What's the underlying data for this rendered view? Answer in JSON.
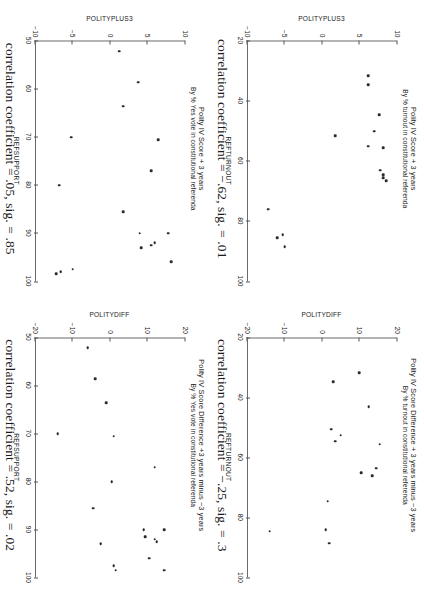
{
  "figure": {
    "orientation": "rotated-90-clockwise",
    "panel_count": 4,
    "marker_color": "#2b2b2b",
    "axis_color": "#6a6a6a"
  },
  "chart_data": [
    {
      "id": "top-left",
      "type": "scatter",
      "title": "Polity IV Score + 3 years",
      "subtitle": "By % turnout in constitutional referenda",
      "xlabel": "REFTURNOUT",
      "ylabel": "POLITYPLUS3",
      "xlim": [
        20,
        100
      ],
      "ylim": [
        -10,
        10
      ],
      "xticks": [
        20,
        40,
        60,
        80,
        100
      ],
      "yticks": [
        10,
        5,
        0,
        -5,
        -10
      ],
      "grid": false,
      "caption": "correlation coefficient = −.62, sig. = .01",
      "correlation_coefficient": -0.62,
      "significance": 0.01,
      "points": [
        {
          "x": 31.5,
          "y": 6.2
        },
        {
          "x": 34.5,
          "y": 6.2
        },
        {
          "x": 44.5,
          "y": 7.7
        },
        {
          "x": 50.0,
          "y": 7.0
        },
        {
          "x": 51.5,
          "y": 1.8
        },
        {
          "x": 55.5,
          "y": 8.2
        },
        {
          "x": 55.0,
          "y": 6.2
        },
        {
          "x": 63.0,
          "y": 7.8
        },
        {
          "x": 64.5,
          "y": 8.2
        },
        {
          "x": 65.5,
          "y": 8.2
        },
        {
          "x": 66.5,
          "y": 8.6
        },
        {
          "x": 76.0,
          "y": -7.2
        },
        {
          "x": 84.5,
          "y": -5.3
        },
        {
          "x": 85.5,
          "y": -6.0
        },
        {
          "x": 88.5,
          "y": -5.0
        }
      ]
    },
    {
      "id": "top-right",
      "type": "scatter",
      "title": "Polity IV Score Difference + 3 years minus −3 years",
      "subtitle": "By % turnout in constitutional referenda",
      "xlabel": "REFTURNOUT",
      "ylabel": "POLITYDIFF",
      "xlim": [
        20,
        100
      ],
      "ylim": [
        -20,
        20
      ],
      "xticks": [
        20,
        40,
        60,
        80,
        100
      ],
      "yticks": [
        20,
        10,
        0,
        -10,
        -20
      ],
      "grid": false,
      "caption": "correlation coefficient = −.25, sig. = .3",
      "correlation_coefficient": -0.25,
      "significance": 0.3,
      "points": [
        {
          "x": 31.5,
          "y": 10.0
        },
        {
          "x": 34.5,
          "y": 3.0
        },
        {
          "x": 43.0,
          "y": 12.5
        },
        {
          "x": 50.5,
          "y": 2.5
        },
        {
          "x": 52.5,
          "y": 5.0
        },
        {
          "x": 54.5,
          "y": 3.5
        },
        {
          "x": 55.5,
          "y": 15.5
        },
        {
          "x": 63.5,
          "y": 14.5
        },
        {
          "x": 65.0,
          "y": 10.5
        },
        {
          "x": 66.0,
          "y": 13.5
        },
        {
          "x": 74.5,
          "y": 1.5
        },
        {
          "x": 84.0,
          "y": 1.0
        },
        {
          "x": 84.5,
          "y": -14.0
        },
        {
          "x": 88.5,
          "y": 2.0
        }
      ]
    },
    {
      "id": "bottom-left",
      "type": "scatter",
      "title": "Polity IV Score + 3 years",
      "subtitle": "By % Yes vote in constitutional referenda",
      "xlabel": "REFSUPPORT",
      "ylabel": "POLITYPLUS3",
      "xlim": [
        50,
        100
      ],
      "ylim": [
        -10,
        10
      ],
      "xticks": [
        50,
        60,
        70,
        80,
        90,
        100
      ],
      "yticks": [
        10,
        5,
        0,
        -5,
        -10
      ],
      "grid": false,
      "caption": "correlation coefficient = .05, sig. = .85",
      "correlation_coefficient": 0.05,
      "significance": 0.85,
      "points": [
        {
          "x": 52.0,
          "y": 1.2
        },
        {
          "x": 58.5,
          "y": 3.8
        },
        {
          "x": 63.5,
          "y": 1.8
        },
        {
          "x": 70.5,
          "y": 6.5
        },
        {
          "x": 70.0,
          "y": -5.2
        },
        {
          "x": 77.0,
          "y": 5.5
        },
        {
          "x": 80.0,
          "y": -6.8
        },
        {
          "x": 85.5,
          "y": 1.8
        },
        {
          "x": 90.0,
          "y": 7.8
        },
        {
          "x": 90.0,
          "y": 4.0
        },
        {
          "x": 92.0,
          "y": 6.0
        },
        {
          "x": 92.5,
          "y": 5.5
        },
        {
          "x": 93.0,
          "y": 4.2
        },
        {
          "x": 96.0,
          "y": 8.2
        },
        {
          "x": 97.5,
          "y": -5.0
        },
        {
          "x": 98.0,
          "y": -6.6
        },
        {
          "x": 98.5,
          "y": -7.2
        }
      ]
    },
    {
      "id": "bottom-right",
      "type": "scatter",
      "title": "Polity IV Score Difference +3 years minus −3 years",
      "subtitle": "By % Yes vote in constitutional referenda",
      "xlabel": "REFSUPPORT",
      "ylabel": "POLITYDIFF",
      "xlim": [
        50,
        100
      ],
      "ylim": [
        -20,
        20
      ],
      "xticks": [
        50,
        60,
        70,
        80,
        90,
        100
      ],
      "yticks": [
        20,
        10,
        0,
        -10,
        -20
      ],
      "grid": false,
      "caption": "correlation coefficient = .52, sig. = .02",
      "correlation_coefficient": 0.52,
      "significance": 0.02,
      "points": [
        {
          "x": 52.0,
          "y": -6.0
        },
        {
          "x": 58.5,
          "y": -4.0
        },
        {
          "x": 63.5,
          "y": -1.0
        },
        {
          "x": 70.0,
          "y": -14.0
        },
        {
          "x": 70.5,
          "y": 1.0
        },
        {
          "x": 77.0,
          "y": 12.0
        },
        {
          "x": 80.0,
          "y": 0.5
        },
        {
          "x": 85.5,
          "y": -4.5
        },
        {
          "x": 90.0,
          "y": 14.5
        },
        {
          "x": 90.0,
          "y": 9.0
        },
        {
          "x": 91.5,
          "y": 9.5
        },
        {
          "x": 92.0,
          "y": 12.0
        },
        {
          "x": 92.5,
          "y": 12.5
        },
        {
          "x": 93.0,
          "y": -2.5
        },
        {
          "x": 96.0,
          "y": 10.5
        },
        {
          "x": 97.5,
          "y": 1.0
        },
        {
          "x": 98.5,
          "y": 14.5
        },
        {
          "x": 98.5,
          "y": 1.5
        }
      ]
    }
  ]
}
